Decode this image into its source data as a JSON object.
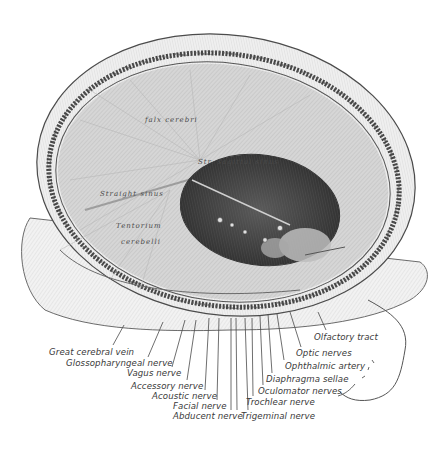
{
  "figure": {
    "inner_labels": [
      {
        "text": "falx cerebri",
        "x": 145,
        "y": 116
      },
      {
        "text": "Tentorium",
        "x": 116,
        "y": 222
      },
      {
        "text": "cerebelli",
        "x": 121,
        "y": 238
      },
      {
        "text": "Str. sagittal sinus",
        "x": 198,
        "y": 158
      },
      {
        "text": "Straight sinus",
        "x": 100,
        "y": 190
      }
    ],
    "left_labels": [
      {
        "text": "Great cerebral vein",
        "x": 49,
        "y": 348
      },
      {
        "text": "Glossopharyngeal nerve",
        "x": 66,
        "y": 359
      },
      {
        "text": "Vagus nerve",
        "x": 127,
        "y": 369
      },
      {
        "text": "Accessory nerve",
        "x": 131,
        "y": 382
      },
      {
        "text": "Acoustic nerve",
        "x": 152,
        "y": 392
      },
      {
        "text": "Facial nerve",
        "x": 173,
        "y": 402
      },
      {
        "text": "Abducent nerve",
        "x": 173,
        "y": 412
      }
    ],
    "right_labels": [
      {
        "text": "Olfactory tract",
        "x": 314,
        "y": 333
      },
      {
        "text": "Optic nerves",
        "x": 296,
        "y": 349
      },
      {
        "text": "Ophthalmic artery",
        "x": 285,
        "y": 362
      },
      {
        "text": "Diaphragma sellae",
        "x": 266,
        "y": 375
      },
      {
        "text": "Oculomator nerves",
        "x": 258,
        "y": 387
      },
      {
        "text": "Trochlear nerve",
        "x": 246,
        "y": 398
      },
      {
        "text": "Trigeminal nerve",
        "x": 241,
        "y": 412
      }
    ],
    "leader_lines": [
      [
        124,
        325,
        113,
        345
      ],
      [
        163,
        322,
        148,
        357
      ],
      [
        185,
        320,
        172,
        367
      ],
      [
        196,
        320,
        187,
        380
      ],
      [
        209,
        318,
        205,
        390
      ],
      [
        219,
        318,
        217,
        400
      ],
      [
        231,
        318,
        231,
        410
      ],
      [
        236,
        318,
        237,
        410
      ],
      [
        245,
        318,
        248,
        410
      ],
      [
        252,
        318,
        253,
        396
      ],
      [
        260,
        316,
        263,
        385
      ],
      [
        268,
        314,
        272,
        373
      ],
      [
        277,
        314,
        284,
        360
      ],
      [
        290,
        312,
        301,
        347
      ],
      [
        318,
        312,
        326,
        330
      ]
    ]
  }
}
